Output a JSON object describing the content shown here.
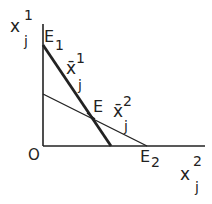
{
  "diagram": {
    "y_axis": {
      "var": "x",
      "sup": "1",
      "sub": "j"
    },
    "x_axis": {
      "var": "x",
      "sup": "2",
      "sub": "j"
    },
    "origin": "O",
    "points": {
      "E1": {
        "base": "E",
        "sub": "1"
      },
      "E2": {
        "base": "E",
        "sub": "2"
      },
      "E": {
        "base": "E"
      }
    },
    "lines": {
      "line1": {
        "label": "x̄",
        "sup": "1",
        "sub": "j",
        "style": "thick"
      },
      "line2": {
        "label": "x̄",
        "sup": "2",
        "sub": "j",
        "style": "thin"
      }
    },
    "colors": {
      "ink": "#222222",
      "background": "#ffffff"
    }
  }
}
